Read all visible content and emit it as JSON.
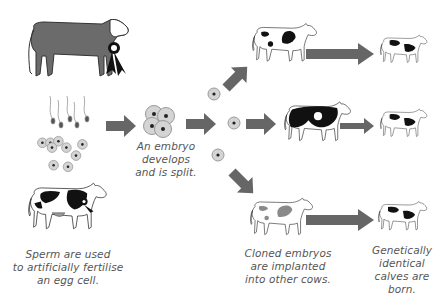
{
  "diagram": {
    "colors": {
      "arrow": "#666666",
      "cell_fill": "#d4d4d4",
      "cell_ring": "#9a9a9a",
      "nucleus": "#222222",
      "bull": "#6b6b6b",
      "spots": "#111111",
      "surrogate_spots": "#8a8a8a",
      "text": "#555555"
    },
    "nodes": [
      {
        "id": "bull",
        "label": "Prize bull (with rosette)"
      },
      {
        "id": "sperm",
        "label": "Sperm"
      },
      {
        "id": "eggs",
        "label": "Egg cells"
      },
      {
        "id": "cow",
        "label": "Prize cow (with rosette)"
      },
      {
        "id": "embryo",
        "label": "Embryo"
      },
      {
        "id": "split-cells",
        "label": "Split embryo cells"
      },
      {
        "id": "surrogate-1",
        "label": "Surrogate cow"
      },
      {
        "id": "surrogate-2",
        "label": "Surrogate cow"
      },
      {
        "id": "surrogate-3",
        "label": "Surrogate cow"
      },
      {
        "id": "calf-1",
        "label": "Calf"
      },
      {
        "id": "calf-2",
        "label": "Calf"
      },
      {
        "id": "calf-3",
        "label": "Calf"
      }
    ],
    "captions": {
      "step1": [
        "Sperm are used",
        "to artificially fertilise",
        "an egg cell."
      ],
      "step2": [
        "An embryo",
        "develops",
        "and is split."
      ],
      "step3": [
        "Cloned embryos",
        "are implanted",
        "into other cows."
      ],
      "step4": [
        "Genetically",
        "identical",
        "calves are",
        "born."
      ]
    }
  }
}
